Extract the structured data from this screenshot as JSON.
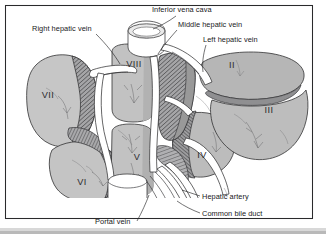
{
  "figure": {
    "caption": "",
    "frame": {
      "border_color": "#2a2a2c",
      "background": "#ffffff"
    },
    "palette": {
      "outline": "#2e2e30",
      "parenchyma_light": "#c9c9c9",
      "parenchyma_mid": "#a8a8a8",
      "parenchyma_dark": "#8d8d8f",
      "cut_surface": "#9a9a9c",
      "vessel_fill": "#ffffff",
      "label_text": "#18181a",
      "shadow": "#b9b9b9"
    }
  },
  "labels": [
    {
      "id": "inferior-vena-cava",
      "text": "Inferior vena cava",
      "x": 152,
      "y": 12,
      "anchor": "start"
    },
    {
      "id": "middle-hepatic-vein",
      "text": "Middle hepatic vein",
      "x": 178,
      "y": 27,
      "anchor": "start"
    },
    {
      "id": "left-hepatic-vein",
      "text": "Left hepatic vein",
      "x": 203,
      "y": 42,
      "anchor": "start"
    },
    {
      "id": "right-hepatic-vein",
      "text": "Right hepatic vein",
      "x": 32,
      "y": 31,
      "anchor": "start"
    },
    {
      "id": "hepatic-artery",
      "text": "Hepatic artery",
      "x": 202,
      "y": 199,
      "anchor": "start"
    },
    {
      "id": "common-bile-duct",
      "text": "Common bile duct",
      "x": 202,
      "y": 216,
      "anchor": "start"
    },
    {
      "id": "portal-vein",
      "text": "Portal vein",
      "x": 95,
      "y": 224,
      "anchor": "start"
    }
  ],
  "segments": [
    {
      "id": "segment-vii",
      "numeral": "VII",
      "x": 48,
      "y": 98
    },
    {
      "id": "segment-viii",
      "numeral": "VIII",
      "x": 134,
      "y": 67
    },
    {
      "id": "segment-ii",
      "numeral": "II",
      "x": 232,
      "y": 68
    },
    {
      "id": "segment-iii",
      "numeral": "III",
      "x": 269,
      "y": 113
    },
    {
      "id": "segment-vi",
      "numeral": "VI",
      "x": 82,
      "y": 185
    },
    {
      "id": "segment-v",
      "numeral": "V",
      "x": 137,
      "y": 160
    },
    {
      "id": "segment-iv",
      "numeral": "IV",
      "x": 202,
      "y": 158
    }
  ],
  "structures": [
    {
      "id": "inferior-vena-cava-stump",
      "name": "Inferior vena cava"
    },
    {
      "id": "right-hepatic-vein-trunk",
      "name": "Right hepatic vein"
    },
    {
      "id": "middle-hepatic-vein-trunk",
      "name": "Middle hepatic vein"
    },
    {
      "id": "left-hepatic-vein-trunk",
      "name": "Left hepatic vein"
    },
    {
      "id": "portal-vein-trunk",
      "name": "Portal vein"
    },
    {
      "id": "hepatic-artery-trunk",
      "name": "Hepatic artery"
    },
    {
      "id": "common-bile-duct-trunk",
      "name": "Common bile duct"
    }
  ]
}
